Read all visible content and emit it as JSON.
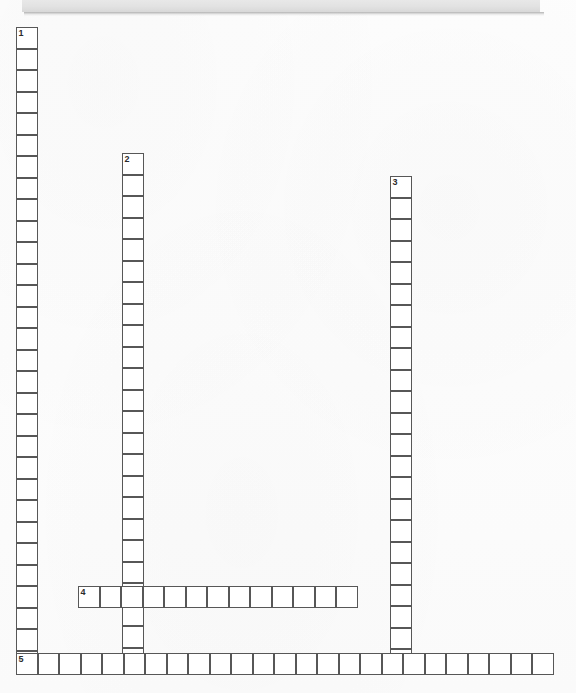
{
  "puzzle": {
    "title": "Crossword Puzzle Grid",
    "cell_size": 21.5,
    "border_color": "#575757",
    "cell_fill": "#ffffff",
    "banner_color": "#e4e4e4",
    "numbers": [
      "1",
      "2",
      "3",
      "4",
      "5"
    ],
    "entries": [
      {
        "number": "1",
        "direction": "down",
        "length": 30,
        "start_x": 16,
        "start_y": 27,
        "value": ""
      },
      {
        "number": "2",
        "direction": "down",
        "length": 24,
        "start_x": 122,
        "start_y": 153,
        "value": ""
      },
      {
        "number": "3",
        "direction": "down",
        "length": 23,
        "start_x": 390,
        "start_y": 176,
        "value": ""
      },
      {
        "number": "4",
        "direction": "across",
        "length": 13,
        "start_x": 78,
        "start_y": 586,
        "value": ""
      },
      {
        "number": "5",
        "direction": "across",
        "length": 25,
        "start_x": 16,
        "start_y": 653,
        "value": ""
      }
    ]
  }
}
